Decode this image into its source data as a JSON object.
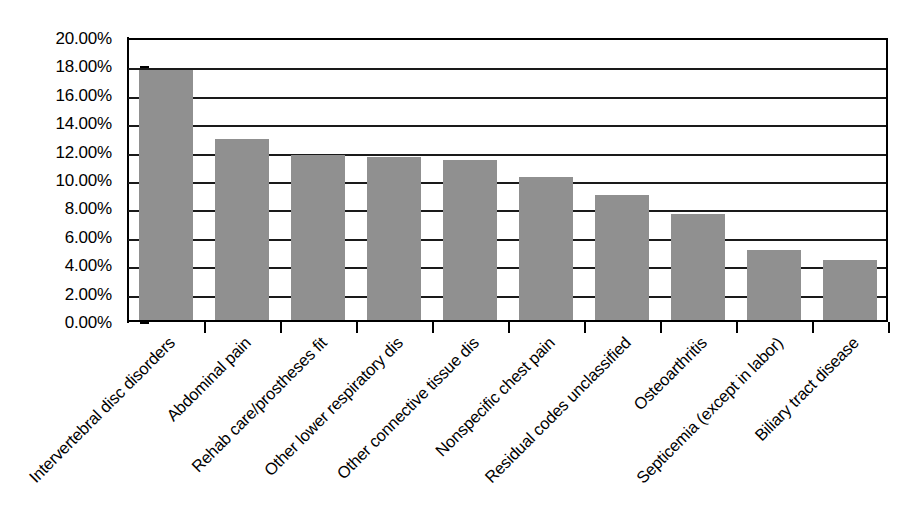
{
  "chart_data": {
    "type": "bar",
    "title": "",
    "subtitle": "",
    "xlabel": "",
    "ylabel": "",
    "ylim": [
      0,
      0.2
    ],
    "grid": true,
    "legend": "none",
    "orientation": "vertical",
    "bar_color": "#909090",
    "categories": [
      "Intervertebral disc disorders",
      "Abdominal pain",
      "Rehab care/prostheses fit",
      "Other lower respiratory dis",
      "Other connective tissue dis",
      "Nonspecific chest pain",
      "Residual codes unclassified",
      "Osteoarthritis",
      "Septicemia (except in labor)",
      "Biliary tract disease"
    ],
    "values": [
      17.6,
      12.75,
      11.65,
      11.45,
      11.3,
      10.1,
      8.8,
      7.45,
      4.95,
      4.25
    ],
    "value_unit": "%",
    "y_ticks": [
      "0.00%",
      "2.00%",
      "4.00%",
      "6.00%",
      "8.00%",
      "10.00%",
      "12.00%",
      "14.00%",
      "16.00%",
      "18.00%",
      "20.00%"
    ],
    "y_tick_values": [
      0,
      2,
      4,
      6,
      8,
      10,
      12,
      14,
      16,
      18,
      20
    ]
  }
}
